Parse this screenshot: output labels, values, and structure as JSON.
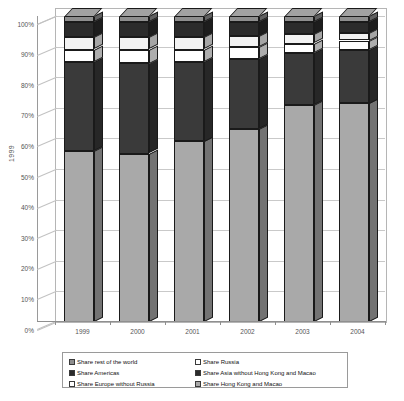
{
  "chart_data": {
    "type": "bar",
    "subtype": "stacked-100-percent-3d",
    "title": "",
    "xlabel": "",
    "ylabel": "1999",
    "categories": [
      "1999",
      "2000",
      "2001",
      "2002",
      "2003",
      "2004"
    ],
    "ylim": [
      0,
      100
    ],
    "ytick_labels": [
      "0%",
      "10%",
      "20%",
      "30%",
      "40%",
      "50%",
      "60%",
      "70%",
      "80%",
      "90%",
      "100%"
    ],
    "ytick_values": [
      0,
      10,
      20,
      30,
      40,
      50,
      60,
      70,
      80,
      90,
      100
    ],
    "grid": true,
    "legend_position": "bottom",
    "stack_order_bottom_to_top": [
      "Share Hong Kong and Macao",
      "Share Asia without Hong Kong and Macao",
      "Share Europe without Russia",
      "Share Russia",
      "Share Americas",
      "Share rest of the world"
    ],
    "series": [
      {
        "name": "Share Hong Kong and Macao",
        "color": "#a9a9a9",
        "values": [
          56.0,
          55.0,
          59.0,
          63.0,
          71.0,
          71.5
        ]
      },
      {
        "name": "Share Asia without Hong Kong and Macao",
        "color": "#3a3a3a",
        "values": [
          29.0,
          29.5,
          26.0,
          23.0,
          17.0,
          17.5
        ]
      },
      {
        "name": "Share Europe without Russia",
        "color": "#ffffff",
        "values": [
          4.0,
          4.5,
          4.0,
          4.0,
          3.0,
          3.0
        ]
      },
      {
        "name": "Share Russia",
        "color": "#f2f2f2",
        "values": [
          4.0,
          4.0,
          4.0,
          3.5,
          3.0,
          2.5
        ]
      },
      {
        "name": "Share Americas",
        "color": "#2b2b2b",
        "values": [
          5.0,
          5.0,
          5.0,
          4.5,
          4.0,
          3.5
        ]
      },
      {
        "name": "Share rest of the world",
        "color": "#8e8e8e",
        "values": [
          2.0,
          2.0,
          2.0,
          2.0,
          2.0,
          2.0
        ]
      }
    ]
  },
  "legend": {
    "items": [
      {
        "label": "Share rest of the world",
        "swatch": "#8e8e8e",
        "col": 1
      },
      {
        "label": "Share Americas",
        "swatch": "#2b2b2b",
        "col": 1
      },
      {
        "label": "Share Europe without Russia",
        "swatch": "#ffffff",
        "col": 1
      },
      {
        "label": "Share Russia",
        "swatch": "#ffffff",
        "col": 2
      },
      {
        "label": "Share Asia without Hong Kong and Macao",
        "swatch": "#2b2b2b",
        "col": 2
      },
      {
        "label": "Share Hong Kong and Macao",
        "swatch": "#a9a9a9",
        "col": 2
      }
    ]
  },
  "colors": {
    "grid": "#c9c9c9",
    "axis": "#8f8f8f",
    "frame": "#b5b5b5",
    "text": "#555555",
    "background": "#ffffff"
  }
}
